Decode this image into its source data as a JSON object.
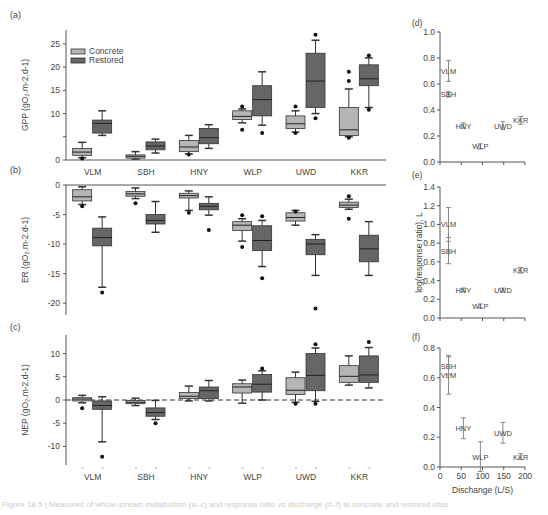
{
  "colors": {
    "concrete": "#b5b5b5",
    "restored": "#666666",
    "axis": "#555555",
    "text": "#444444",
    "errorbar": "#888888"
  },
  "legend": {
    "concrete_label": "Concrete",
    "restored_label": "Restored"
  },
  "caption": "Figure 18.5 | Measures of whole-stream metabolism (a–c) and response ratio vs discharge (d–f) at concrete and restored sites",
  "chart_data": [
    {
      "panel": "(a)",
      "type": "box",
      "title": "",
      "ylabel": "GPP (gO₂.m-2.d-1)",
      "ylim": [
        0,
        28
      ],
      "yticks": [
        0,
        5,
        10,
        15,
        20,
        25
      ],
      "ytick_labels": [
        "0",
        "",
        "10",
        "15",
        "20",
        "25"
      ],
      "categories": [
        "VLM",
        "SBH",
        "HNY",
        "WLP",
        "UWD",
        "KKR"
      ],
      "series": [
        {
          "name": "Concrete",
          "boxes": [
            {
              "min": 0.5,
              "q1": 1.0,
              "median": 1.7,
              "q3": 2.5,
              "max": 3.8,
              "outliers": [
                0.3
              ]
            },
            {
              "min": 0.2,
              "q1": 0.4,
              "median": 0.8,
              "q3": 1.1,
              "max": 1.8,
              "outliers": []
            },
            {
              "min": 1.3,
              "q1": 1.8,
              "median": 2.8,
              "q3": 4.2,
              "max": 5.3,
              "outliers": [
                1.2
              ]
            },
            {
              "min": 8.0,
              "q1": 8.7,
              "median": 9.4,
              "q3": 10.6,
              "max": 11.0,
              "outliers": [
                6.5,
                11.5
              ]
            },
            {
              "min": 6.0,
              "q1": 6.8,
              "median": 7.8,
              "q3": 9.5,
              "max": 10.6,
              "outliers": [
                5.8,
                11.5
              ]
            },
            {
              "min": 5.0,
              "q1": 5.3,
              "median": 6.5,
              "q3": 11.3,
              "max": 15.3,
              "outliers": [
                4.8,
                17.0,
                19.0
              ]
            }
          ]
        },
        {
          "name": "Restored",
          "boxes": [
            {
              "min": 5.3,
              "q1": 5.8,
              "median": 7.9,
              "q3": 8.6,
              "max": 10.6,
              "outliers": []
            },
            {
              "min": 1.5,
              "q1": 2.2,
              "median": 3.0,
              "q3": 3.9,
              "max": 4.5,
              "outliers": []
            },
            {
              "min": 2.5,
              "q1": 3.5,
              "median": 4.8,
              "q3": 6.8,
              "max": 7.6,
              "outliers": []
            },
            {
              "min": 7.5,
              "q1": 9.5,
              "median": 13.0,
              "q3": 16.0,
              "max": 19.0,
              "outliers": [
                5.8
              ]
            },
            {
              "min": 10.0,
              "q1": 11.3,
              "median": 17.0,
              "q3": 23.0,
              "max": 25.8,
              "outliers": [
                9.0,
                27.0
              ]
            },
            {
              "min": 11.3,
              "q1": 16.0,
              "median": 17.5,
              "q3": 20.5,
              "max": 22.0,
              "outliers": [
                10.8,
                22.5
              ]
            }
          ]
        }
      ]
    },
    {
      "panel": "(b)",
      "type": "box",
      "ylabel": "ER (gO₂.m-2.d-1)",
      "ylim": [
        -22,
        0
      ],
      "yticks": [
        0,
        -5,
        -10,
        -15,
        -20
      ],
      "ytick_labels": [
        "0",
        "-5",
        "-10",
        "-15",
        "-20"
      ],
      "categories": [
        "VLM",
        "SBH",
        "HNY",
        "WLP",
        "UWD",
        "KKR"
      ],
      "series": [
        {
          "name": "Concrete",
          "boxes": [
            {
              "min": -3.3,
              "q1": -2.7,
              "median": -2.0,
              "q3": -0.8,
              "max": -0.3,
              "outliers": [
                -3.6
              ]
            },
            {
              "min": -2.3,
              "q1": -1.9,
              "median": -1.5,
              "q3": -1.1,
              "max": -0.5,
              "outliers": [
                -3.1
              ]
            },
            {
              "min": -4.3,
              "q1": -2.2,
              "median": -1.8,
              "q3": -1.4,
              "max": -1.0,
              "outliers": [
                -4.7
              ]
            },
            {
              "min": -9.5,
              "q1": -7.7,
              "median": -6.8,
              "q3": -6.2,
              "max": -5.7,
              "outliers": [
                -5.1,
                -10.5
              ]
            },
            {
              "min": -6.8,
              "q1": -6.1,
              "median": -5.5,
              "q3": -4.7,
              "max": -4.3,
              "outliers": [
                -4.5
              ]
            },
            {
              "min": -4.1,
              "q1": -3.8,
              "median": -3.4,
              "q3": -2.9,
              "max": -2.4,
              "outliers": [
                -1.9,
                -5.7
              ]
            }
          ]
        },
        {
          "name": "Restored",
          "boxes": [
            {
              "min": -17.3,
              "q1": -10.3,
              "median": -8.9,
              "q3": -7.3,
              "max": -5.4,
              "outliers": [
                -18.2
              ]
            },
            {
              "min": -8.0,
              "q1": -6.6,
              "median": -6.0,
              "q3": -5.0,
              "max": -2.8,
              "outliers": []
            },
            {
              "min": -5.1,
              "q1": -4.2,
              "median": -3.6,
              "q3": -3.1,
              "max": -2.0,
              "outliers": [
                -7.6
              ]
            },
            {
              "min": -13.8,
              "q1": -11.1,
              "median": -9.4,
              "q3": -6.9,
              "max": -6.0,
              "outliers": [
                -5.3,
                -15.8
              ]
            },
            {
              "min": -15.3,
              "q1": -11.8,
              "median": -10.0,
              "q3": -9.2,
              "max": -8.4,
              "outliers": [
                -20.9
              ]
            },
            {
              "min": -15.3,
              "q1": -13.0,
              "median": -10.8,
              "q3": -8.5,
              "max": -6.2,
              "outliers": []
            }
          ]
        }
      ]
    },
    {
      "panel": "(c)",
      "type": "box",
      "ylabel": "NEP (gO₂.m-2.d-1)",
      "ylim": [
        -14,
        14
      ],
      "yticks": [
        10,
        5,
        0,
        -5,
        -10
      ],
      "ytick_labels": [
        "10",
        "5",
        "0",
        "-5",
        "-10"
      ],
      "reference_line": 0,
      "categories": [
        "VLM",
        "SBH",
        "HNY",
        "WLP",
        "UWD",
        "KKR"
      ],
      "series": [
        {
          "name": "Concrete",
          "boxes": [
            {
              "min": -0.6,
              "q1": -0.2,
              "median": 0.2,
              "q3": 0.5,
              "max": 1.0,
              "outliers": [
                -1.8
              ]
            },
            {
              "min": -1.2,
              "q1": -0.8,
              "median": -0.5,
              "q3": -0.1,
              "max": 0.4,
              "outliers": []
            },
            {
              "min": -0.2,
              "q1": 0.3,
              "median": 0.8,
              "q3": 1.6,
              "max": 3.0,
              "outliers": []
            },
            {
              "min": -0.7,
              "q1": 1.5,
              "median": 2.8,
              "q3": 3.5,
              "max": 4.3,
              "outliers": []
            },
            {
              "min": -0.5,
              "q1": 1.2,
              "median": 2.1,
              "q3": 4.8,
              "max": 6.0,
              "outliers": [
                -0.8
              ]
            },
            {
              "min": 3.2,
              "q1": 3.8,
              "median": 5.1,
              "q3": 7.4,
              "max": 9.5,
              "outliers": []
            }
          ]
        },
        {
          "name": "Restored",
          "boxes": [
            {
              "min": -9.0,
              "q1": -2.0,
              "median": -1.2,
              "q3": -0.2,
              "max": 0.7,
              "outliers": [
                -12.2
              ]
            },
            {
              "min": -4.2,
              "q1": -3.5,
              "median": -2.7,
              "q3": -1.7,
              "max": -0.1,
              "outliers": [
                -5.0
              ]
            },
            {
              "min": -0.2,
              "q1": 0.3,
              "median": 2.0,
              "q3": 2.8,
              "max": 4.2,
              "outliers": []
            },
            {
              "min": 0.0,
              "q1": 1.7,
              "median": 3.4,
              "q3": 5.5,
              "max": 6.3,
              "outliers": [
                6.8
              ]
            },
            {
              "min": -0.3,
              "q1": 2.0,
              "median": 5.3,
              "q3": 10.0,
              "max": 11.2,
              "outliers": [
                -0.8,
                12.0
              ]
            },
            {
              "min": 2.6,
              "q1": 3.8,
              "median": 5.4,
              "q3": 9.5,
              "max": 11.3,
              "outliers": [
                12.5
              ]
            }
          ]
        }
      ]
    },
    {
      "panel": "(d)",
      "type": "scatter",
      "ylabel": "",
      "xlim": [
        0,
        200
      ],
      "ylim": [
        0,
        1.0
      ],
      "yticks": [
        0.0,
        0.2,
        0.4,
        0.6,
        0.8,
        1.0
      ],
      "ytick_labels": [
        "0.0",
        "0.2",
        "0.4",
        "0.6",
        "0.8",
        "1.0"
      ],
      "points": [
        {
          "label": "VLM",
          "x": 20,
          "y": 0.7,
          "err": 0.08
        },
        {
          "label": "SBH",
          "x": 20,
          "y": 0.52,
          "err": 0.02
        },
        {
          "label": "HNY",
          "x": 55,
          "y": 0.28,
          "err": 0.02
        },
        {
          "label": "WLP",
          "x": 95,
          "y": 0.12,
          "err": 0.02
        },
        {
          "label": "UWD",
          "x": 148,
          "y": 0.28,
          "err": 0.03
        },
        {
          "label": "KKR",
          "x": 190,
          "y": 0.32,
          "err": 0.03
        }
      ]
    },
    {
      "panel": "(e)",
      "type": "scatter",
      "ylabel": "log(response ratio), L",
      "xlim": [
        0,
        200
      ],
      "ylim": [
        0,
        1.4
      ],
      "yticks": [
        0.0,
        0.2,
        0.4,
        0.6,
        0.8,
        1.0,
        1.2,
        1.4
      ],
      "ytick_labels": [
        "0.0",
        "0.2",
        "0.4",
        "0.6",
        "0.8",
        "1.0",
        "1.2",
        "1.4"
      ],
      "points": [
        {
          "label": "VLM",
          "x": 20,
          "y": 1.0,
          "err": 0.18
        },
        {
          "label": "SBH",
          "x": 20,
          "y": 0.72,
          "err": 0.14
        },
        {
          "label": "HNY",
          "x": 55,
          "y": 0.3,
          "err": 0.02
        },
        {
          "label": "WLP",
          "x": 95,
          "y": 0.13,
          "err": 0.02
        },
        {
          "label": "UWD",
          "x": 148,
          "y": 0.3,
          "err": 0.02
        },
        {
          "label": "KKR",
          "x": 190,
          "y": 0.51,
          "err": 0.03
        }
      ]
    },
    {
      "panel": "(f)",
      "type": "scatter",
      "ylabel": "",
      "xlabel": "Dischange (L/S)",
      "xlim": [
        0,
        200
      ],
      "xticks": [
        0,
        50,
        100,
        150,
        200
      ],
      "xtick_labels": [
        "0",
        "50",
        "100",
        "150",
        "200"
      ],
      "ylim": [
        0,
        0.8
      ],
      "yticks": [
        0.0,
        0.2,
        0.4,
        0.6,
        0.8
      ],
      "ytick_labels": [
        "0.0",
        "0.2",
        "0.4",
        "0.6",
        "0.8"
      ],
      "points": [
        {
          "label": "SBH",
          "x": 20,
          "y": 0.68,
          "err": 0.06
        },
        {
          "label": "VLM",
          "x": 20,
          "y": 0.62,
          "err": 0.13
        },
        {
          "label": "HNY",
          "x": 55,
          "y": 0.26,
          "err": 0.07
        },
        {
          "label": "WLP",
          "x": 95,
          "y": 0.07,
          "err": 0.1
        },
        {
          "label": "UWD",
          "x": 148,
          "y": 0.23,
          "err": 0.07
        },
        {
          "label": "KKR",
          "x": 190,
          "y": 0.07,
          "err": 0.02
        }
      ]
    }
  ]
}
